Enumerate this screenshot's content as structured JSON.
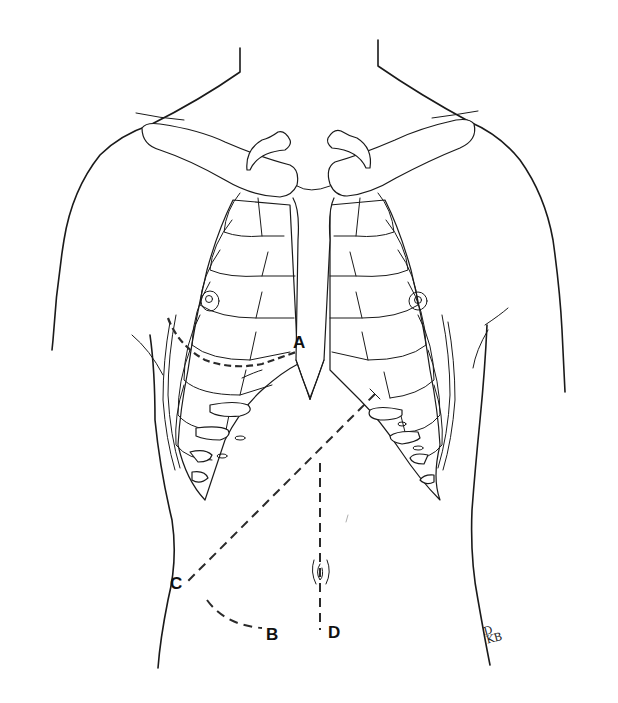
{
  "figure": {
    "background_color": "#ffffff",
    "line_color": "#1a1a1a"
  },
  "labels": {
    "a": "A",
    "b": "B",
    "c": "C",
    "d": "D"
  },
  "incisions": [
    {
      "id": "A",
      "description": "dashed line along right inframammary/rib margin ending near sternum"
    },
    {
      "id": "C",
      "description": "dashed oblique line from left costal margin to right flank point C"
    },
    {
      "id": "B",
      "description": "dashed curved line from C toward B in lower right abdomen"
    },
    {
      "id": "D",
      "description": "dashed vertical midline line through umbilicus down to D"
    }
  ],
  "signature": {
    "initials_top": "D",
    "initials_bottom": "KB"
  }
}
